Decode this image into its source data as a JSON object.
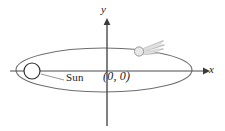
{
  "figure": {
    "background_color": "#ffffff",
    "stroke_color": "#6e6e6e",
    "axis_color": "#4a4a4a",
    "text_color": "#1a1a1a",
    "tail_color": "#b8b8b8"
  },
  "axes": {
    "x_label": "x",
    "y_label": "y",
    "origin_label": "(0, 0)",
    "origin_x": 107,
    "origin_y": 71,
    "x_axis_start": 10,
    "x_axis_end": 205,
    "y_axis_top": 19,
    "y_axis_bottom": 126,
    "arrowheads": [
      "x-positive",
      "y-positive"
    ]
  },
  "orbit": {
    "shape": "ellipse",
    "center_x": 104,
    "center_y": 70,
    "semi_major_axis": 88,
    "semi_minor_axis": 22,
    "stroke_width": 1
  },
  "sun": {
    "label": "Sun",
    "center_x": 32,
    "center_y": 71,
    "radius": 8,
    "fill": "#ffffff",
    "leader_line_from_x": 41,
    "leader_line_from_y": 74,
    "leader_line_to_x": 64,
    "leader_line_to_y": 80
  },
  "comet": {
    "center_x": 139,
    "center_y": 51,
    "radius": 4.5,
    "fill": "#e4e4e4",
    "tail_direction": "upper-right",
    "tail_streak_count": 4
  }
}
